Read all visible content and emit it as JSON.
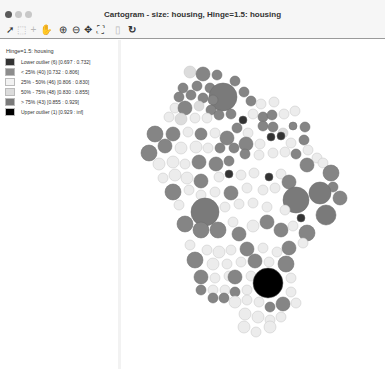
{
  "window": {
    "title": "Cartogram - size: housing, Hinge=1.5: housing",
    "traffic_lights": [
      {
        "name": "close",
        "color": "#5a5a5a"
      },
      {
        "name": "minimize",
        "color": "#c8c8c8"
      },
      {
        "name": "maximize",
        "color": "#c8c8c8"
      }
    ]
  },
  "toolbar": {
    "tools": [
      {
        "name": "select-arrow-icon",
        "glyph": "➚",
        "enabled": true
      },
      {
        "name": "select-region-icon",
        "glyph": "⬚",
        "enabled": false
      },
      {
        "name": "crosshair-icon",
        "glyph": "+",
        "enabled": false
      },
      {
        "name": "pan-hand-icon",
        "glyph": "✋",
        "enabled": false
      },
      {
        "name": "zoom-in-icon",
        "glyph": "⊕",
        "enabled": true
      },
      {
        "name": "zoom-out-icon",
        "glyph": "⊖",
        "enabled": true
      },
      {
        "name": "pan-arrows-icon",
        "glyph": "✥",
        "enabled": true
      },
      {
        "name": "fit-extent-icon",
        "glyph": "⛶",
        "enabled": true
      },
      {
        "name": "copy-icon",
        "glyph": "▯",
        "enabled": false
      },
      {
        "name": "refresh-icon",
        "glyph": "↻",
        "enabled": true
      }
    ]
  },
  "legend": {
    "title": "Hinge=1.5: housing",
    "items": [
      {
        "label": "Lower outlier (6)  [0.697 : 0.732]",
        "color": "#333333"
      },
      {
        "label": "< 25% (40)  [0.732 : 0.806]",
        "color": "#8c8c8c"
      },
      {
        "label": "25% - 50% (46)  [0.806 : 0.830]",
        "color": "#f2f2f2"
      },
      {
        "label": "50% - 75% (48)  [0.830 : 0.855]",
        "color": "#dcdcdc"
      },
      {
        "label": "> 75% (43)  [0.855 : 0.929]",
        "color": "#7a7a7a"
      },
      {
        "label": "Upper outlier (1)  [0.929 : inf]",
        "color": "#000000"
      }
    ]
  },
  "map": {
    "variable": "housing",
    "classes": {
      "lo": "#333333",
      "q1": "#858585",
      "q2": "#ececec",
      "q3": "#dcdcdc",
      "q4": "#7a7a7a",
      "up": "#000000"
    },
    "circles": [
      [
        69,
        32,
        6,
        "q3"
      ],
      [
        82,
        34,
        7,
        "q1"
      ],
      [
        96,
        35,
        5,
        "q1"
      ],
      [
        114,
        41,
        5,
        "q1"
      ],
      [
        62,
        48,
        5,
        "q1"
      ],
      [
        76,
        46,
        5,
        "q1"
      ],
      [
        89,
        48,
        5,
        "q1"
      ],
      [
        102,
        57,
        14,
        "q4"
      ],
      [
        58,
        57,
        5,
        "q1"
      ],
      [
        70,
        55,
        5,
        "q1"
      ],
      [
        82,
        58,
        5,
        "q1"
      ],
      [
        92,
        60,
        5,
        "q1"
      ],
      [
        54,
        68,
        5,
        "q2"
      ],
      [
        64,
        68,
        7,
        "q1"
      ],
      [
        78,
        66,
        5,
        "q3"
      ],
      [
        90,
        70,
        5,
        "q1"
      ],
      [
        123,
        52,
        5,
        "q1"
      ],
      [
        130,
        61,
        5,
        "q1"
      ],
      [
        140,
        64,
        5,
        "q2"
      ],
      [
        153,
        62,
        5,
        "q2"
      ],
      [
        48,
        77,
        5,
        "q2"
      ],
      [
        60,
        79,
        6,
        "q3"
      ],
      [
        74,
        78,
        5,
        "q2"
      ],
      [
        86,
        78,
        5,
        "q2"
      ],
      [
        98,
        75,
        5,
        "q1"
      ],
      [
        110,
        74,
        5,
        "q1"
      ],
      [
        122,
        80,
        4,
        "lo"
      ],
      [
        132,
        74,
        5,
        "q2"
      ],
      [
        142,
        77,
        5,
        "q1"
      ],
      [
        151,
        75,
        5,
        "q1"
      ],
      [
        163,
        74,
        5,
        "q2"
      ],
      [
        174,
        71,
        5,
        "q2"
      ],
      [
        34,
        94,
        8,
        "q1"
      ],
      [
        52,
        94,
        7,
        "q1"
      ],
      [
        67,
        92,
        5,
        "q2"
      ],
      [
        80,
        94,
        6,
        "q1"
      ],
      [
        94,
        93,
        5,
        "q2"
      ],
      [
        106,
        98,
        7,
        "q1"
      ],
      [
        116,
        88,
        5,
        "q1"
      ],
      [
        127,
        93,
        5,
        "q2"
      ],
      [
        142,
        86,
        5,
        "q1"
      ],
      [
        152,
        87,
        5,
        "q1"
      ],
      [
        162,
        93,
        5,
        "q3"
      ],
      [
        172,
        86,
        4,
        "q1"
      ],
      [
        184,
        87,
        5,
        "q1"
      ],
      [
        28,
        113,
        8,
        "q1"
      ],
      [
        44,
        106,
        7,
        "q1"
      ],
      [
        60,
        108,
        6,
        "q2"
      ],
      [
        75,
        107,
        6,
        "q2"
      ],
      [
        87,
        108,
        5,
        "q2"
      ],
      [
        99,
        108,
        5,
        "q1"
      ],
      [
        113,
        108,
        5,
        "q1"
      ],
      [
        125,
        104,
        7,
        "q1"
      ],
      [
        139,
        104,
        5,
        "q2"
      ],
      [
        150,
        97,
        4,
        "lo"
      ],
      [
        160,
        96,
        4,
        "lo"
      ],
      [
        170,
        103,
        5,
        "q2"
      ],
      [
        183,
        100,
        5,
        "q1"
      ],
      [
        38,
        124,
        6,
        "q2"
      ],
      [
        52,
        122,
        6,
        "q2"
      ],
      [
        64,
        124,
        5,
        "q2"
      ],
      [
        78,
        122,
        7,
        "q1"
      ],
      [
        95,
        124,
        7,
        "q1"
      ],
      [
        108,
        121,
        5,
        "q1"
      ],
      [
        124,
        114,
        5,
        "q1"
      ],
      [
        138,
        115,
        5,
        "q2"
      ],
      [
        152,
        113,
        5,
        "q2"
      ],
      [
        164,
        112,
        5,
        "q2"
      ],
      [
        175,
        114,
        5,
        "q1"
      ],
      [
        187,
        110,
        5,
        "q2"
      ],
      [
        196,
        118,
        5,
        "q2"
      ],
      [
        42,
        138,
        5,
        "q2"
      ],
      [
        54,
        135,
        6,
        "q2"
      ],
      [
        66,
        138,
        6,
        "q2"
      ],
      [
        80,
        141,
        7,
        "q1"
      ],
      [
        98,
        137,
        5,
        "q2"
      ],
      [
        108,
        134,
        4,
        "lo"
      ],
      [
        120,
        135,
        5,
        "q2"
      ],
      [
        133,
        133,
        5,
        "q2"
      ],
      [
        148,
        137,
        4,
        "lo"
      ],
      [
        160,
        134,
        5,
        "q2"
      ],
      [
        168,
        142,
        7,
        "q1"
      ],
      [
        186,
        125,
        7,
        "q1"
      ],
      [
        202,
        123,
        5,
        "q2"
      ],
      [
        210,
        133,
        8,
        "q1"
      ],
      [
        212,
        147,
        5,
        "q1"
      ],
      [
        52,
        152,
        8,
        "q1"
      ],
      [
        68,
        150,
        5,
        "q2"
      ],
      [
        80,
        155,
        5,
        "q2"
      ],
      [
        94,
        152,
        5,
        "q2"
      ],
      [
        110,
        153,
        7,
        "q1"
      ],
      [
        126,
        148,
        5,
        "q2"
      ],
      [
        142,
        150,
        5,
        "q2"
      ],
      [
        154,
        148,
        5,
        "q2"
      ],
      [
        175,
        160,
        13,
        "q4"
      ],
      [
        199,
        153,
        11,
        "q4"
      ],
      [
        219,
        158,
        7,
        "q1"
      ],
      [
        58,
        165,
        5,
        "q2"
      ],
      [
        84,
        172,
        14,
        "q4"
      ],
      [
        104,
        167,
        5,
        "q2"
      ],
      [
        118,
        164,
        5,
        "q2"
      ],
      [
        132,
        163,
        5,
        "q2"
      ],
      [
        146,
        167,
        5,
        "q2"
      ],
      [
        164,
        170,
        5,
        "q2"
      ],
      [
        180,
        178,
        4,
        "lo"
      ],
      [
        205,
        175,
        10,
        "q4"
      ],
      [
        64,
        184,
        8,
        "q1"
      ],
      [
        80,
        190,
        8,
        "q1"
      ],
      [
        97,
        190,
        8,
        "q1"
      ],
      [
        112,
        182,
        5,
        "q2"
      ],
      [
        118,
        194,
        7,
        "q1"
      ],
      [
        132,
        186,
        6,
        "q2"
      ],
      [
        146,
        182,
        7,
        "q1"
      ],
      [
        160,
        190,
        7,
        "q1"
      ],
      [
        172,
        186,
        5,
        "q2"
      ],
      [
        186,
        193,
        8,
        "q1"
      ],
      [
        69,
        205,
        5,
        "q2"
      ],
      [
        86,
        210,
        5,
        "q2"
      ],
      [
        98,
        212,
        6,
        "q2"
      ],
      [
        110,
        210,
        5,
        "q2"
      ],
      [
        126,
        209,
        7,
        "q1"
      ],
      [
        142,
        208,
        5,
        "q2"
      ],
      [
        156,
        212,
        5,
        "q2"
      ],
      [
        168,
        208,
        7,
        "q1"
      ],
      [
        182,
        203,
        5,
        "q2"
      ],
      [
        74,
        220,
        8,
        "q1"
      ],
      [
        92,
        224,
        6,
        "q2"
      ],
      [
        106,
        224,
        5,
        "q2"
      ],
      [
        120,
        222,
        5,
        "q2"
      ],
      [
        134,
        221,
        7,
        "q1"
      ],
      [
        148,
        222,
        5,
        "q2"
      ],
      [
        165,
        224,
        8,
        "q1"
      ],
      [
        80,
        237,
        7,
        "q1"
      ],
      [
        94,
        238,
        5,
        "q2"
      ],
      [
        108,
        236,
        5,
        "q2"
      ],
      [
        114,
        237,
        7,
        "q1"
      ],
      [
        130,
        236,
        5,
        "q2"
      ],
      [
        147,
        243,
        15,
        "up"
      ],
      [
        170,
        238,
        5,
        "q2"
      ],
      [
        80,
        250,
        5,
        "q1"
      ],
      [
        92,
        250,
        5,
        "q2"
      ],
      [
        104,
        250,
        5,
        "q2"
      ],
      [
        114,
        252,
        5,
        "q1"
      ],
      [
        126,
        250,
        5,
        "q2"
      ],
      [
        170,
        252,
        5,
        "q2"
      ],
      [
        92,
        258,
        5,
        "q1"
      ],
      [
        103,
        258,
        5,
        "q1"
      ],
      [
        114,
        262,
        6,
        "q2"
      ],
      [
        126,
        260,
        5,
        "q2"
      ],
      [
        138,
        262,
        5,
        "q2"
      ],
      [
        149,
        267,
        5,
        "q1"
      ],
      [
        162,
        264,
        7,
        "q1"
      ],
      [
        175,
        263,
        5,
        "q2"
      ],
      [
        124,
        274,
        6,
        "q2"
      ],
      [
        137,
        277,
        6,
        "q2"
      ],
      [
        149,
        280,
        5,
        "q2"
      ],
      [
        160,
        277,
        5,
        "q2"
      ],
      [
        123,
        287,
        6,
        "q2"
      ],
      [
        135,
        292,
        5,
        "q2"
      ],
      [
        149,
        287,
        6,
        "q2"
      ]
    ]
  }
}
